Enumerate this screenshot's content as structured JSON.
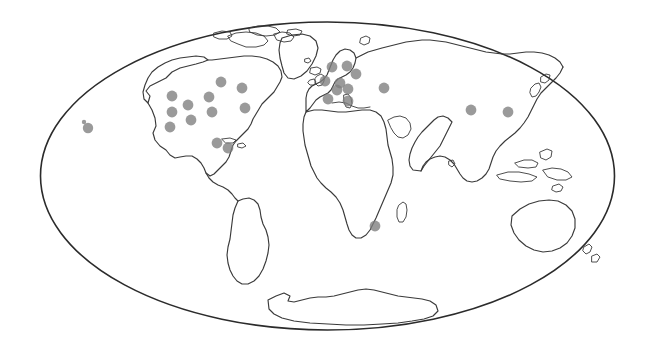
{
  "figure": {
    "type": "point-distribution-world-map",
    "projection": "mollweide-ellipse",
    "title": "",
    "background_color": "#ffffff",
    "coastline_color": "#3a3a3a",
    "ellipse_border_color": "#2b2b2b",
    "marker_color": "#7d7d7d",
    "marker_opacity": "0.78",
    "marker_shape": "circle",
    "marker_count": 26,
    "legend": null,
    "axis_labels": [],
    "tick_labels": [],
    "annotations": []
  },
  "chart_data": {
    "type": "scatter",
    "title": "",
    "xlabel": "",
    "ylabel": "",
    "xlim": [
      40,
      615
    ],
    "ylim": [
      22,
      330
    ],
    "grid": false,
    "legend_position": "none",
    "series": [
      {
        "name": "locations",
        "color": "#7d7d7d",
        "points": [
          {
            "region": "hawaii",
            "x": 88,
            "y": 128,
            "r": 5.2
          },
          {
            "region": "hawaii-small",
            "x": 84,
            "y": 122,
            "r": 2.2
          },
          {
            "region": "pacific-nw",
            "x": 172,
            "y": 96,
            "r": 5.4
          },
          {
            "region": "western-us",
            "x": 172,
            "y": 112,
            "r": 5.4
          },
          {
            "region": "southwest-us",
            "x": 170,
            "y": 127,
            "r": 5.4
          },
          {
            "region": "mountain-west",
            "x": 188,
            "y": 105,
            "r": 5.4
          },
          {
            "region": "central-us",
            "x": 191,
            "y": 120,
            "r": 5.4
          },
          {
            "region": "midwest-us",
            "x": 209,
            "y": 97,
            "r": 5.4
          },
          {
            "region": "great-lakes",
            "x": 212,
            "y": 112,
            "r": 5.4
          },
          {
            "region": "canada-prairie",
            "x": 221,
            "y": 82,
            "r": 5.4
          },
          {
            "region": "northeast-us",
            "x": 242,
            "y": 88,
            "r": 5.4
          },
          {
            "region": "maritimes",
            "x": 245,
            "y": 108,
            "r": 5.4
          },
          {
            "region": "florida",
            "x": 217,
            "y": 143,
            "r": 5.4
          },
          {
            "region": "caribbean",
            "x": 228,
            "y": 148,
            "r": 5.4
          },
          {
            "region": "scandinavia-n",
            "x": 347,
            "y": 66,
            "r": 5.4
          },
          {
            "region": "norway",
            "x": 332,
            "y": 67,
            "r": 5.4
          },
          {
            "region": "finland",
            "x": 356,
            "y": 74,
            "r": 5.4
          },
          {
            "region": "uk",
            "x": 325,
            "y": 81,
            "r": 5.4
          },
          {
            "region": "denmark",
            "x": 340,
            "y": 83,
            "r": 5.4
          },
          {
            "region": "germany",
            "x": 348,
            "y": 89,
            "r": 5.4
          },
          {
            "region": "netherlands",
            "x": 337,
            "y": 90,
            "r": 5.4
          },
          {
            "region": "france",
            "x": 328,
            "y": 99,
            "r": 5.4
          },
          {
            "region": "italy",
            "x": 348,
            "y": 101,
            "r": 5.4
          },
          {
            "region": "turkey-caucasus",
            "x": 384,
            "y": 88,
            "r": 5.4
          },
          {
            "region": "china",
            "x": 471,
            "y": 110,
            "r": 5.4
          },
          {
            "region": "japan-korea",
            "x": 508,
            "y": 112,
            "r": 5.4
          },
          {
            "region": "south-africa",
            "x": 375,
            "y": 226,
            "r": 5.4
          }
        ]
      }
    ]
  }
}
